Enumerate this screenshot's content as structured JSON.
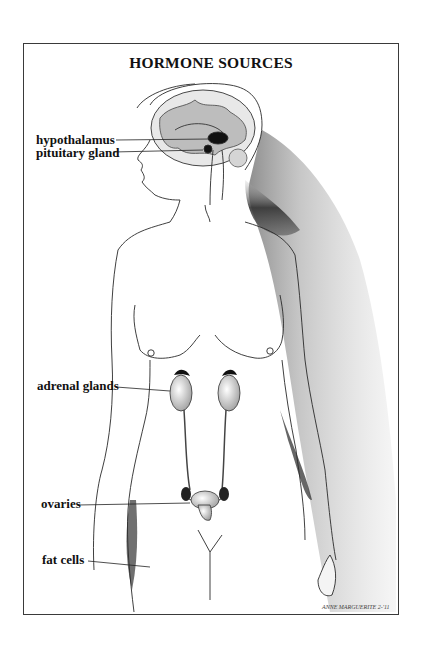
{
  "title": "HORMONE SOURCES",
  "labels": {
    "hypothalamus": "hypothalamus",
    "pituitary": "pituitary gland",
    "adrenal": "adrenal glands",
    "ovaries": "ovaries",
    "fat": "fat cells"
  },
  "signature": "ANNE MARGUERITE 2-'11",
  "colors": {
    "line": "#2a2a2a",
    "shade": "#555555",
    "border": "#3a3a3a"
  }
}
